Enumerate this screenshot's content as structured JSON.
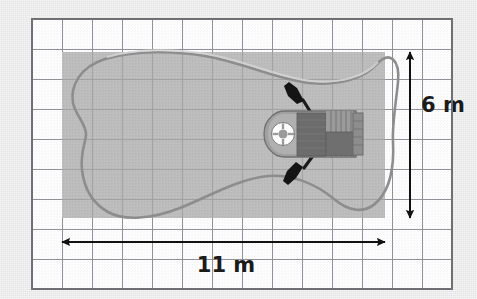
{
  "figure": {
    "kind": "scale-diagram",
    "background_color": "#e9e9e9"
  },
  "grid": {
    "name": "square-grid",
    "columns": 14,
    "rows": 9,
    "cell_size_px": 30,
    "origin_x_px": 32,
    "origin_y_px": 19,
    "cell_fill_color": "#fdfdfd",
    "line_color": "#8e8e94",
    "border_color": "#6f6f75"
  },
  "pond": {
    "name": "pond-shape",
    "fill_color": "#bcbcbc",
    "outline_color": "#8c8c8c",
    "bounding_rect": {
      "x_px": 62,
      "y_px": 52,
      "width_px": 323,
      "height_px": 166
    }
  },
  "boat": {
    "name": "rowing-boat",
    "hull_color": "#9a9a9a",
    "hull_outline_color": "#6e6e6e",
    "deck_color": "#6e6e6e",
    "plank_color": "#8a8a8a",
    "paddle_color": "#1a1a1a",
    "life_ring_color": "#ffffff",
    "position": {
      "x_px": 268,
      "y_px": 108,
      "width_px": 110,
      "height_px": 52
    },
    "parts": [
      "bow-life-ring",
      "forward-seat-block",
      "plank-deck",
      "rear-seat-block",
      "stern-transom",
      "upper-oar",
      "lower-oar"
    ]
  },
  "dimensions": {
    "horizontal": {
      "name": "width-dimension",
      "label": "11 m",
      "value": 11,
      "unit": "m",
      "arrow_color": "#111111",
      "x1_px": 62,
      "x2_px": 385,
      "y_px": 242,
      "label_x_px": 226,
      "label_y_px": 270
    },
    "vertical": {
      "name": "height-dimension",
      "label": "6 m",
      "value": 6,
      "unit": "m",
      "arrow_color": "#111111",
      "x_px": 410,
      "y1_px": 52,
      "y2_px": 218,
      "label_x_px": 443,
      "label_y_px": 112
    }
  },
  "scale": {
    "name": "grid-scale",
    "metres_per_cell": 0.786,
    "note": "pond is 11 m wide and 6 m tall"
  }
}
